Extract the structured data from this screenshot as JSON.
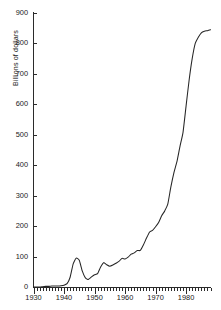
{
  "chart_data": {
    "type": "line",
    "title": "",
    "xlabel": "",
    "ylabel": "Billions of dollars",
    "xlim": [
      1930,
      1988
    ],
    "ylim": [
      0,
      900
    ],
    "grid": false,
    "legend": null,
    "y_ticks": [
      0,
      100,
      200,
      300,
      400,
      500,
      600,
      700,
      800,
      900
    ],
    "y_tick_labels": [
      "0",
      "100",
      "200",
      "300",
      "400",
      "500",
      "600",
      "700",
      "800",
      "900"
    ],
    "x_ticks_major": [
      1930,
      1940,
      1950,
      1960,
      1970,
      1980
    ],
    "x_tick_labels": [
      "1930",
      "1940",
      "1950",
      "1960",
      "1970",
      "1980"
    ],
    "x_tick_minor_step": 1,
    "line_color": "#262626",
    "series": [
      {
        "name": "Billions of dollars",
        "x": [
          1930,
          1931,
          1932,
          1933,
          1934,
          1935,
          1936,
          1937,
          1938,
          1939,
          1940,
          1941,
          1942,
          1943,
          1944,
          1945,
          1946,
          1947,
          1948,
          1949,
          1950,
          1951,
          1952,
          1953,
          1954,
          1955,
          1956,
          1957,
          1958,
          1959,
          1960,
          1961,
          1962,
          1963,
          1964,
          1965,
          1966,
          1967,
          1968,
          1969,
          1970,
          1971,
          1972,
          1973,
          1974,
          1975,
          1976,
          1977,
          1978,
          1979,
          1980,
          1981,
          1982,
          1983,
          1984,
          1985,
          1986,
          1987,
          1988
        ],
        "values": [
          3,
          3,
          3,
          4,
          5,
          5,
          6,
          6,
          6,
          7,
          9,
          14,
          35,
          79,
          95,
          92,
          55,
          34,
          30,
          39,
          43,
          45,
          68,
          76,
          71,
          68,
          71,
          76,
          82,
          92,
          92,
          98,
          107,
          111,
          119,
          118,
          135,
          158,
          178,
          184,
          196,
          211,
          232,
          247,
          269,
          326,
          372,
          409,
          459,
          504,
          591,
          678,
          746,
          808,
          852,
          946,
          990,
          1004,
          1064
        ],
        "display_values": [
          0,
          0,
          0,
          1,
          2,
          2,
          3,
          3,
          3,
          4,
          6,
          11,
          32,
          76,
          95,
          88,
          52,
          30,
          25,
          33,
          40,
          44,
          66,
          80,
          73,
          68,
          72,
          78,
          84,
          94,
          92,
          98,
          108,
          112,
          120,
          120,
          138,
          160,
          180,
          186,
          198,
          212,
          234,
          250,
          272,
          328,
          375,
          412,
          462,
          508,
          595,
          680,
          750,
          800,
          820,
          835,
          840,
          842,
          845
        ]
      }
    ],
    "annotations": []
  }
}
